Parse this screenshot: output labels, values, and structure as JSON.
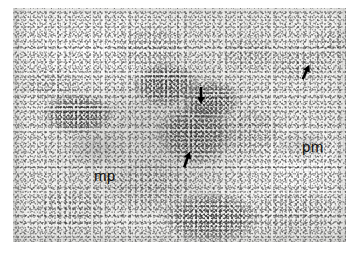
{
  "figure": {
    "kind": "electron-microscope-autoradiograph",
    "plate": {
      "background_color": "#f1f1ef",
      "border_color": "#ffffff",
      "x": 13,
      "y": 8,
      "width": 333,
      "height": 234
    },
    "labels": [
      {
        "id": "mp",
        "text": "mp",
        "x": 81,
        "y": 160,
        "color": "#0d0d0d"
      },
      {
        "id": "pm",
        "text": "pm",
        "x": 289,
        "y": 131,
        "color": "#0d0d0d"
      }
    ],
    "arrows": [
      {
        "id": "arrow-center-top",
        "x": 181,
        "y": 79,
        "direction": "down",
        "rotation": 0,
        "length": 17,
        "color": "#000000"
      },
      {
        "id": "arrow-center-lower",
        "x": 167,
        "y": 143,
        "direction": "up-left",
        "rotation": 200,
        "length": 17,
        "color": "#000000"
      },
      {
        "id": "arrow-upper-right",
        "x": 286,
        "y": 56,
        "direction": "down-left",
        "rotation": 205,
        "length": 16,
        "color": "#000000"
      }
    ],
    "grain_clusters": [
      {
        "id": "cluster-1",
        "x": 100,
        "y": 18,
        "w": 78,
        "h": 44,
        "style": "soft"
      },
      {
        "id": "cluster-2",
        "x": 8,
        "y": 60,
        "w": 62,
        "h": 34,
        "style": "soft"
      },
      {
        "id": "cluster-3",
        "x": 30,
        "y": 86,
        "w": 70,
        "h": 40,
        "style": "dense"
      },
      {
        "id": "cluster-4",
        "x": 120,
        "y": 55,
        "w": 66,
        "h": 44,
        "style": "dense"
      },
      {
        "id": "cluster-5",
        "x": 145,
        "y": 95,
        "w": 74,
        "h": 62,
        "style": "dense"
      },
      {
        "id": "cluster-6",
        "x": 170,
        "y": 72,
        "w": 56,
        "h": 40,
        "style": "dense"
      },
      {
        "id": "cluster-7",
        "x": 206,
        "y": 28,
        "w": 58,
        "h": 36,
        "style": "soft"
      },
      {
        "id": "cluster-8",
        "x": 258,
        "y": 38,
        "w": 62,
        "h": 36,
        "style": "soft"
      },
      {
        "id": "cluster-9",
        "x": 298,
        "y": 22,
        "w": 50,
        "h": 30,
        "style": "soft"
      },
      {
        "id": "cluster-10",
        "x": 200,
        "y": 100,
        "w": 72,
        "h": 50,
        "style": "soft"
      },
      {
        "id": "cluster-11",
        "x": 96,
        "y": 150,
        "w": 88,
        "h": 56,
        "style": "soft"
      },
      {
        "id": "cluster-12",
        "x": 150,
        "y": 185,
        "w": 96,
        "h": 50,
        "style": "dense"
      },
      {
        "id": "cluster-13",
        "x": 20,
        "y": 178,
        "w": 76,
        "h": 46,
        "style": "soft"
      },
      {
        "id": "cluster-14",
        "x": 236,
        "y": 180,
        "w": 90,
        "h": 48,
        "style": "soft"
      },
      {
        "id": "cluster-15",
        "x": 264,
        "y": 120,
        "w": 54,
        "h": 34,
        "style": "haze"
      },
      {
        "id": "cluster-16",
        "x": 54,
        "y": 120,
        "w": 60,
        "h": 40,
        "style": "haze"
      }
    ]
  }
}
